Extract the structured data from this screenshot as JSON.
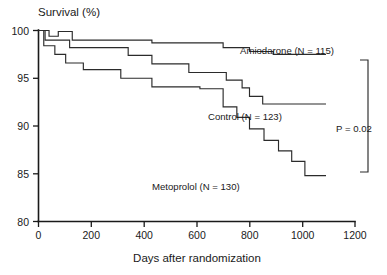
{
  "chart_data": {
    "type": "line",
    "subtype": "kaplan-meier-step",
    "title": "",
    "ylabel": "Survival (%)",
    "xlabel": "Days after randomization",
    "xlim": [
      0,
      1200
    ],
    "ylim": [
      80,
      100
    ],
    "xticks": [
      0,
      200,
      400,
      600,
      800,
      1000,
      1200
    ],
    "xtick_labels": [
      "0",
      "200",
      "400",
      "600",
      "800",
      "1000",
      "1200"
    ],
    "yticks": [
      80,
      85,
      90,
      95,
      100
    ],
    "ytick_labels": [
      "80",
      "85",
      "90",
      "95",
      "100"
    ],
    "grid": false,
    "legend_position": "inline-annotations",
    "annotations": [
      {
        "name": "p-value",
        "text": "P = 0.02"
      }
    ],
    "series": [
      {
        "name": "Amiodarone",
        "n": 115,
        "label": "Amiodarone (N = 115)",
        "color": "#2b2b2b",
        "steps": [
          [
            0,
            100.0
          ],
          [
            30,
            100.0
          ],
          [
            40,
            99.4
          ],
          [
            70,
            99.4
          ],
          [
            75,
            99.9
          ],
          [
            120,
            99.9
          ],
          [
            128,
            99.0
          ],
          [
            420,
            99.0
          ],
          [
            430,
            98.7
          ],
          [
            690,
            98.7
          ],
          [
            700,
            98.2
          ],
          [
            790,
            98.2
          ],
          [
            800,
            97.8
          ],
          [
            880,
            97.8
          ],
          [
            890,
            97.5
          ],
          [
            1090,
            97.5
          ]
        ],
        "final_survival": 97.5
      },
      {
        "name": "Control",
        "n": 123,
        "label": "Control (N = 123)",
        "color": "#2b2b2b",
        "steps": [
          [
            0,
            100.0
          ],
          [
            18,
            100.0
          ],
          [
            25,
            99.0
          ],
          [
            110,
            99.0
          ],
          [
            118,
            98.2
          ],
          [
            330,
            98.2
          ],
          [
            340,
            97.4
          ],
          [
            420,
            97.4
          ],
          [
            430,
            96.5
          ],
          [
            560,
            96.5
          ],
          [
            570,
            95.6
          ],
          [
            700,
            95.6
          ],
          [
            712,
            94.8
          ],
          [
            760,
            94.8
          ],
          [
            772,
            94.0
          ],
          [
            790,
            94.0
          ],
          [
            800,
            93.1
          ],
          [
            840,
            93.1
          ],
          [
            850,
            92.3
          ],
          [
            1090,
            92.3
          ]
        ],
        "final_survival": 92.3
      },
      {
        "name": "Metoprolol",
        "n": 130,
        "label": "Metoprolol (N = 130)",
        "color": "#2b2b2b",
        "steps": [
          [
            0,
            100.0
          ],
          [
            12,
            100.0
          ],
          [
            20,
            98.4
          ],
          [
            55,
            98.4
          ],
          [
            62,
            97.5
          ],
          [
            95,
            97.5
          ],
          [
            103,
            96.6
          ],
          [
            160,
            96.6
          ],
          [
            170,
            95.9
          ],
          [
            300,
            95.9
          ],
          [
            312,
            95.0
          ],
          [
            420,
            95.0
          ],
          [
            430,
            94.1
          ],
          [
            600,
            94.1
          ],
          [
            612,
            93.9
          ],
          [
            690,
            93.9
          ],
          [
            700,
            92.0
          ],
          [
            742,
            92.0
          ],
          [
            752,
            90.9
          ],
          [
            790,
            90.9
          ],
          [
            800,
            89.7
          ],
          [
            845,
            89.7
          ],
          [
            855,
            88.5
          ],
          [
            900,
            88.5
          ],
          [
            910,
            87.4
          ],
          [
            950,
            87.4
          ],
          [
            960,
            86.3
          ],
          [
            1000,
            86.3
          ],
          [
            1010,
            84.8
          ],
          [
            1090,
            84.8
          ]
        ],
        "final_survival": 84.8
      }
    ]
  },
  "labels": {
    "y_axis_title": "Survival (%)",
    "x_axis_title": "Days after randomization",
    "amiodarone": "Amiodarone (N = 115)",
    "control": "Control (N = 123)",
    "metoprolol": "Metoprolol (N = 130)",
    "pvalue": "P = 0.02"
  },
  "ticks": {
    "x": [
      "0",
      "200",
      "400",
      "600",
      "800",
      "1000",
      "1200"
    ],
    "y": [
      "80",
      "85",
      "90",
      "95",
      "100"
    ]
  }
}
